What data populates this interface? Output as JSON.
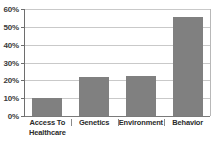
{
  "chart_data": {
    "type": "bar",
    "title": "",
    "subtitle": "",
    "xlabel": "",
    "ylabel": "",
    "categories": [
      "Access To Healthcare",
      "Genetics",
      "Environment",
      "Behavior"
    ],
    "values": [
      10,
      22,
      22.5,
      55.5
    ],
    "value_suffix": "%",
    "ylim": [
      0,
      60
    ],
    "ytick_labels": [
      "60%",
      "50%",
      "40%",
      "30%",
      "20%",
      "10%",
      "0%"
    ],
    "ytick_values": [
      60,
      50,
      40,
      30,
      20,
      10,
      0
    ],
    "grid": true,
    "legend": "none",
    "series": [
      {
        "name": "Share",
        "values": [
          10,
          22,
          22.5,
          55.5
        ]
      }
    ],
    "colors": {
      "bar": "#808080",
      "gridline": "#c9c9c9",
      "axis": "#6e6e6e",
      "baseline": "#7a7a7a",
      "text": "#2b2b2b",
      "background": "#ffffff"
    },
    "category_lines": [
      [
        "Access To",
        "Healthcare"
      ],
      [
        "Genetics"
      ],
      [
        "Environment"
      ],
      [
        "Behavior"
      ]
    ]
  }
}
